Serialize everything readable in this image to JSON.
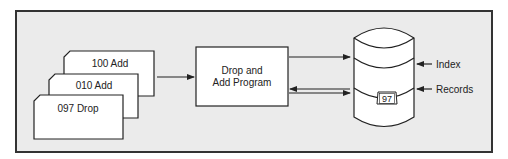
{
  "cards": [
    {
      "label": "100 Add"
    },
    {
      "label": "010 Add"
    },
    {
      "label": "097 Drop"
    }
  ],
  "program": {
    "line1": "Drop and",
    "line2": "Add Program"
  },
  "storage": {
    "tag": "97",
    "index_label": "Index",
    "records_label": "Records"
  },
  "colors": {
    "background": "#ebebeb",
    "frame": "#333333",
    "shape_fill": "#ffffff",
    "stroke": "#222222"
  }
}
